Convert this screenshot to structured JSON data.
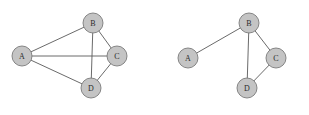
{
  "figure": {
    "background_color": "#ffffff",
    "width": 309,
    "height": 115
  },
  "style": {
    "node_fill": "#c4c4c4",
    "node_stroke": "#7a7a7a",
    "node_radius": 10,
    "node_stroke_width": 0.9,
    "edge_color": "#595959",
    "edge_width": 0.9,
    "label_color": "#2b2b2b",
    "label_font_size": 8
  },
  "graphs": [
    {
      "id": "left-graph",
      "name": "complete-graph",
      "nodes": [
        {
          "id": "A",
          "label": "A",
          "x": 22,
          "y": 56
        },
        {
          "id": "B",
          "label": "B",
          "x": 93,
          "y": 23
        },
        {
          "id": "C",
          "label": "C",
          "x": 117,
          "y": 56
        },
        {
          "id": "D",
          "label": "D",
          "x": 91,
          "y": 88
        }
      ],
      "edges": [
        {
          "from": "A",
          "to": "B"
        },
        {
          "from": "A",
          "to": "C"
        },
        {
          "from": "A",
          "to": "D"
        },
        {
          "from": "B",
          "to": "C"
        },
        {
          "from": "B",
          "to": "D"
        },
        {
          "from": "C",
          "to": "D"
        }
      ]
    },
    {
      "id": "right-graph",
      "name": "reduced-graph",
      "nodes": [
        {
          "id": "A",
          "label": "A",
          "x": 188,
          "y": 58
        },
        {
          "id": "B",
          "label": "B",
          "x": 249,
          "y": 23
        },
        {
          "id": "C",
          "label": "C",
          "x": 276,
          "y": 58
        },
        {
          "id": "D",
          "label": "D",
          "x": 247,
          "y": 88
        }
      ],
      "edges": [
        {
          "from": "A",
          "to": "B"
        },
        {
          "from": "B",
          "to": "C"
        },
        {
          "from": "B",
          "to": "D"
        },
        {
          "from": "C",
          "to": "D"
        }
      ]
    }
  ]
}
